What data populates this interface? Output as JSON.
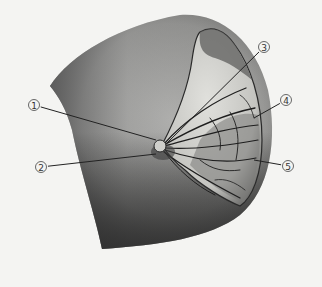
{
  "diagram": {
    "colors": {
      "background": "#f4f4f2",
      "skin_light": "#a9a9a7",
      "skin_dark": "#3e3e3e",
      "gland_fill": "#d2d2ce",
      "duct_stroke": "#1e1e1e",
      "leader_line": "#222222"
    },
    "callouts": [
      {
        "id": 1,
        "label": "①",
        "x": 34,
        "y": 105,
        "tx": 156,
        "ty": 140
      },
      {
        "id": 2,
        "label": "②",
        "x": 41,
        "y": 167,
        "tx": 156,
        "ty": 154
      },
      {
        "id": 3,
        "label": "③",
        "x": 264,
        "y": 47,
        "tx": 166,
        "ty": 144
      },
      {
        "id": 4,
        "label": "④",
        "x": 286,
        "y": 100,
        "tx": 254,
        "ty": 118
      },
      {
        "id": 5,
        "label": "⑤",
        "x": 288,
        "y": 166,
        "tx": 254,
        "ty": 160
      }
    ]
  }
}
